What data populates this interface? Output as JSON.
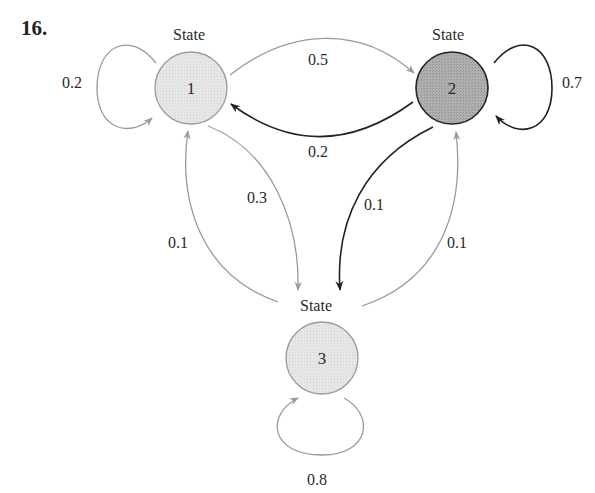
{
  "problem_number": "16.",
  "colors": {
    "light_state_fill": "#e4e4e4",
    "dark_state_fill": "#a8a8a8",
    "gray_arrow": "#9a9a9a",
    "black_arrow": "#222222",
    "text": "#2a2a2a"
  },
  "states": [
    {
      "id": "1",
      "heading": "State",
      "label": "1",
      "shade": "light"
    },
    {
      "id": "2",
      "heading": "State",
      "label": "2",
      "shade": "dark"
    },
    {
      "id": "3",
      "heading": "State",
      "label": "3",
      "shade": "light"
    }
  ],
  "transitions": [
    {
      "from": "1",
      "to": "1",
      "probability": "0.2",
      "style": "gray"
    },
    {
      "from": "1",
      "to": "2",
      "probability": "0.5",
      "style": "gray"
    },
    {
      "from": "2",
      "to": "1",
      "probability": "0.2",
      "style": "black"
    },
    {
      "from": "2",
      "to": "2",
      "probability": "0.7",
      "style": "black"
    },
    {
      "from": "1",
      "to": "3",
      "probability": "0.3",
      "style": "gray"
    },
    {
      "from": "3",
      "to": "1",
      "probability": "0.1",
      "style": "gray"
    },
    {
      "from": "2",
      "to": "3",
      "probability": "0.1",
      "style": "black"
    },
    {
      "from": "3",
      "to": "2",
      "probability": "0.1",
      "style": "gray"
    },
    {
      "from": "3",
      "to": "3",
      "probability": "0.8",
      "style": "gray"
    }
  ]
}
